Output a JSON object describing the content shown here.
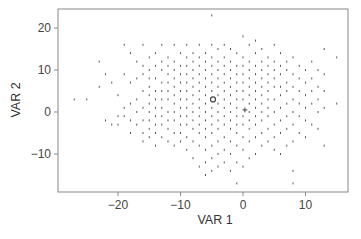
{
  "chart_data": {
    "type": "scatter",
    "title": "",
    "xlabel": "VAR 1",
    "ylabel": "VAR 2",
    "xlim": [
      -28.5,
      16.5
    ],
    "ylim": [
      -18.5,
      25
    ],
    "xticks": [
      -20,
      -10,
      0,
      10
    ],
    "yticks": [
      -10,
      0,
      10,
      20
    ],
    "xtick_labels": [
      "−20",
      "−10",
      "0",
      "10"
    ],
    "ytick_labels": [
      "−10",
      "0",
      "10",
      "20"
    ],
    "grid": false,
    "legend": null,
    "series": [
      {
        "name": "observations",
        "marker": "dot",
        "color": "#555555",
        "points": [
          [
            -27,
            3
          ],
          [
            -25,
            3
          ],
          [
            -23,
            12
          ],
          [
            -23,
            6
          ],
          [
            -22,
            9
          ],
          [
            -21,
            7
          ],
          [
            -22,
            -2
          ],
          [
            -21,
            -3
          ],
          [
            -20,
            4
          ],
          [
            -20,
            -1
          ],
          [
            -20,
            -3
          ],
          [
            -19,
            16
          ],
          [
            -19,
            9
          ],
          [
            -19,
            1
          ],
          [
            -19,
            -1
          ],
          [
            -18,
            14
          ],
          [
            -18,
            7
          ],
          [
            -18,
            2
          ],
          [
            -18,
            -2
          ],
          [
            -18,
            -5
          ],
          [
            -17,
            12
          ],
          [
            -17,
            8
          ],
          [
            -17,
            3
          ],
          [
            -17,
            0
          ],
          [
            -17,
            -3
          ],
          [
            -16,
            16
          ],
          [
            -16,
            11
          ],
          [
            -16,
            9
          ],
          [
            -16,
            5
          ],
          [
            -16,
            1
          ],
          [
            -16,
            -2
          ],
          [
            -16,
            -5
          ],
          [
            -16,
            -7
          ],
          [
            -15,
            13
          ],
          [
            -15,
            10
          ],
          [
            -15,
            8
          ],
          [
            -15,
            6
          ],
          [
            -15,
            4
          ],
          [
            -15,
            2
          ],
          [
            -15,
            0
          ],
          [
            -15,
            -2
          ],
          [
            -15,
            -4
          ],
          [
            -15,
            -6
          ],
          [
            -14,
            14
          ],
          [
            -14,
            11
          ],
          [
            -14,
            8
          ],
          [
            -14,
            5
          ],
          [
            -14,
            3
          ],
          [
            -14,
            1
          ],
          [
            -14,
            -1
          ],
          [
            -14,
            -3
          ],
          [
            -14,
            -5
          ],
          [
            -14,
            -8
          ],
          [
            -13,
            16
          ],
          [
            -13,
            12
          ],
          [
            -13,
            10
          ],
          [
            -13,
            7
          ],
          [
            -13,
            5
          ],
          [
            -13,
            3
          ],
          [
            -13,
            1
          ],
          [
            -13,
            -1
          ],
          [
            -13,
            -3
          ],
          [
            -13,
            -6
          ],
          [
            -12,
            13
          ],
          [
            -12,
            11
          ],
          [
            -12,
            9
          ],
          [
            -12,
            7
          ],
          [
            -12,
            5
          ],
          [
            -12,
            3
          ],
          [
            -12,
            0
          ],
          [
            -12,
            -2
          ],
          [
            -12,
            -4
          ],
          [
            -12,
            -7
          ],
          [
            -11,
            16
          ],
          [
            -11,
            12
          ],
          [
            -11,
            10
          ],
          [
            -11,
            8
          ],
          [
            -11,
            6
          ],
          [
            -11,
            4
          ],
          [
            -11,
            2
          ],
          [
            -11,
            0
          ],
          [
            -11,
            -2
          ],
          [
            -11,
            -5
          ],
          [
            -11,
            -8
          ],
          [
            -10,
            14
          ],
          [
            -10,
            11
          ],
          [
            -10,
            9
          ],
          [
            -10,
            7
          ],
          [
            -10,
            5
          ],
          [
            -10,
            3
          ],
          [
            -10,
            1
          ],
          [
            -10,
            -1
          ],
          [
            -10,
            -3
          ],
          [
            -10,
            -5
          ],
          [
            -10,
            -7
          ],
          [
            -9,
            16
          ],
          [
            -9,
            13
          ],
          [
            -9,
            11
          ],
          [
            -9,
            9
          ],
          [
            -9,
            7
          ],
          [
            -9,
            5
          ],
          [
            -9,
            3
          ],
          [
            -9,
            1
          ],
          [
            -9,
            -1
          ],
          [
            -9,
            -3
          ],
          [
            -9,
            -6
          ],
          [
            -9,
            -9
          ],
          [
            -8,
            14
          ],
          [
            -8,
            12
          ],
          [
            -8,
            10
          ],
          [
            -8,
            8
          ],
          [
            -8,
            6
          ],
          [
            -8,
            4
          ],
          [
            -8,
            2
          ],
          [
            -8,
            0
          ],
          [
            -8,
            -2
          ],
          [
            -8,
            -4
          ],
          [
            -8,
            -7
          ],
          [
            -8,
            -11
          ],
          [
            -7,
            16
          ],
          [
            -7,
            13
          ],
          [
            -7,
            11
          ],
          [
            -7,
            9
          ],
          [
            -7,
            7
          ],
          [
            -7,
            5
          ],
          [
            -7,
            3
          ],
          [
            -7,
            1
          ],
          [
            -7,
            -1
          ],
          [
            -7,
            -3
          ],
          [
            -7,
            -5
          ],
          [
            -7,
            -8
          ],
          [
            -7,
            -13
          ],
          [
            -6,
            14
          ],
          [
            -6,
            12
          ],
          [
            -6,
            10
          ],
          [
            -6,
            8
          ],
          [
            -6,
            6
          ],
          [
            -6,
            4
          ],
          [
            -6,
            2
          ],
          [
            -6,
            0
          ],
          [
            -6,
            -2
          ],
          [
            -6,
            -4
          ],
          [
            -6,
            -6
          ],
          [
            -6,
            -9
          ],
          [
            -6,
            -12
          ],
          [
            -6,
            -15
          ],
          [
            -5,
            23
          ],
          [
            -5,
            16
          ],
          [
            -5,
            13
          ],
          [
            -5,
            11
          ],
          [
            -5,
            9
          ],
          [
            -5,
            7
          ],
          [
            -5,
            5
          ],
          [
            -5,
            1
          ],
          [
            -5,
            -1
          ],
          [
            -5,
            -3
          ],
          [
            -5,
            -5
          ],
          [
            -5,
            -8
          ],
          [
            -5,
            -11
          ],
          [
            -5,
            -14
          ],
          [
            -4,
            15
          ],
          [
            -4,
            12
          ],
          [
            -4,
            10
          ],
          [
            -4,
            8
          ],
          [
            -4,
            6
          ],
          [
            -4,
            4
          ],
          [
            -4,
            2
          ],
          [
            -4,
            0
          ],
          [
            -4,
            -2
          ],
          [
            -4,
            -4
          ],
          [
            -4,
            -7
          ],
          [
            -4,
            -10
          ],
          [
            -4,
            -13
          ],
          [
            -3,
            16
          ],
          [
            -3,
            13
          ],
          [
            -3,
            11
          ],
          [
            -3,
            9
          ],
          [
            -3,
            7
          ],
          [
            -3,
            5
          ],
          [
            -3,
            3
          ],
          [
            -3,
            1
          ],
          [
            -3,
            -1
          ],
          [
            -3,
            -3
          ],
          [
            -3,
            -6
          ],
          [
            -3,
            -9
          ],
          [
            -3,
            -12
          ],
          [
            -2,
            15
          ],
          [
            -2,
            12
          ],
          [
            -2,
            10
          ],
          [
            -2,
            8
          ],
          [
            -2,
            6
          ],
          [
            -2,
            4
          ],
          [
            -2,
            2
          ],
          [
            -2,
            0
          ],
          [
            -2,
            -2
          ],
          [
            -2,
            -4
          ],
          [
            -2,
            -7
          ],
          [
            -2,
            -10
          ],
          [
            -2,
            -14
          ],
          [
            -1,
            14
          ],
          [
            -1,
            11
          ],
          [
            -1,
            9
          ],
          [
            -1,
            7
          ],
          [
            -1,
            5
          ],
          [
            -1,
            3
          ],
          [
            -1,
            1
          ],
          [
            -1,
            -1
          ],
          [
            -1,
            -3
          ],
          [
            -1,
            -5
          ],
          [
            -1,
            -8
          ],
          [
            -1,
            -12
          ],
          [
            -1,
            -17
          ],
          [
            0,
            18
          ],
          [
            0,
            13
          ],
          [
            0,
            11
          ],
          [
            0,
            9
          ],
          [
            0,
            7
          ],
          [
            0,
            5
          ],
          [
            0,
            3
          ],
          [
            0,
            -1
          ],
          [
            0,
            -3
          ],
          [
            0,
            -6
          ],
          [
            0,
            -9
          ],
          [
            0,
            -13
          ],
          [
            1,
            16
          ],
          [
            1,
            12
          ],
          [
            1,
            10
          ],
          [
            1,
            8
          ],
          [
            1,
            6
          ],
          [
            1,
            4
          ],
          [
            1,
            2
          ],
          [
            1,
            0
          ],
          [
            1,
            -2
          ],
          [
            1,
            -4
          ],
          [
            1,
            -7
          ],
          [
            1,
            -11
          ],
          [
            2,
            17
          ],
          [
            2,
            14
          ],
          [
            2,
            11
          ],
          [
            2,
            9
          ],
          [
            2,
            7
          ],
          [
            2,
            5
          ],
          [
            2,
            3
          ],
          [
            2,
            1
          ],
          [
            2,
            -1
          ],
          [
            2,
            -3
          ],
          [
            2,
            -6
          ],
          [
            2,
            -10
          ],
          [
            3,
            15
          ],
          [
            3,
            12
          ],
          [
            3,
            10
          ],
          [
            3,
            8
          ],
          [
            3,
            6
          ],
          [
            3,
            4
          ],
          [
            3,
            2
          ],
          [
            3,
            0
          ],
          [
            3,
            -2
          ],
          [
            3,
            -5
          ],
          [
            3,
            -8
          ],
          [
            4,
            13
          ],
          [
            4,
            11
          ],
          [
            4,
            9
          ],
          [
            4,
            7
          ],
          [
            4,
            5
          ],
          [
            4,
            3
          ],
          [
            4,
            1
          ],
          [
            4,
            -1
          ],
          [
            4,
            -4
          ],
          [
            4,
            -7
          ],
          [
            5,
            16
          ],
          [
            5,
            12
          ],
          [
            5,
            10
          ],
          [
            5,
            8
          ],
          [
            5,
            6
          ],
          [
            5,
            3
          ],
          [
            5,
            0
          ],
          [
            5,
            -3
          ],
          [
            5,
            -6
          ],
          [
            5,
            -9
          ],
          [
            6,
            14
          ],
          [
            6,
            11
          ],
          [
            6,
            9
          ],
          [
            6,
            6
          ],
          [
            6,
            4
          ],
          [
            6,
            1
          ],
          [
            6,
            -2
          ],
          [
            6,
            -5
          ],
          [
            6,
            -10
          ],
          [
            7,
            12
          ],
          [
            7,
            10
          ],
          [
            7,
            7
          ],
          [
            7,
            5
          ],
          [
            7,
            2
          ],
          [
            7,
            -1
          ],
          [
            7,
            -4
          ],
          [
            7,
            -8
          ],
          [
            8,
            13
          ],
          [
            8,
            9
          ],
          [
            8,
            6
          ],
          [
            8,
            3
          ],
          [
            8,
            0
          ],
          [
            8,
            -3
          ],
          [
            8,
            -7
          ],
          [
            8,
            -14
          ],
          [
            8,
            -17
          ],
          [
            9,
            11
          ],
          [
            9,
            8
          ],
          [
            9,
            5
          ],
          [
            9,
            2
          ],
          [
            9,
            -1
          ],
          [
            9,
            -5
          ],
          [
            10,
            10
          ],
          [
            10,
            7
          ],
          [
            10,
            4
          ],
          [
            10,
            1
          ],
          [
            10,
            -2
          ],
          [
            10,
            -6
          ],
          [
            11,
            12
          ],
          [
            11,
            8
          ],
          [
            11,
            5
          ],
          [
            11,
            2
          ],
          [
            11,
            -3
          ],
          [
            12,
            10
          ],
          [
            12,
            6
          ],
          [
            12,
            3
          ],
          [
            12,
            0
          ],
          [
            12,
            -4
          ],
          [
            13,
            15
          ],
          [
            13,
            9
          ],
          [
            13,
            5
          ],
          [
            13,
            1
          ],
          [
            13,
            -8
          ],
          [
            15,
            13
          ],
          [
            15,
            2
          ]
        ]
      },
      {
        "name": "centroid",
        "marker": "open-circle",
        "color": "#444444",
        "points": [
          [
            -4.8,
            3
          ]
        ]
      },
      {
        "name": "reference",
        "marker": "cross",
        "color": "#444444",
        "points": [
          [
            0.3,
            0.5
          ]
        ]
      }
    ]
  },
  "colors": {
    "frame": "#888888",
    "tick": "#888888",
    "points": "#555555",
    "background": "#ffffff"
  }
}
